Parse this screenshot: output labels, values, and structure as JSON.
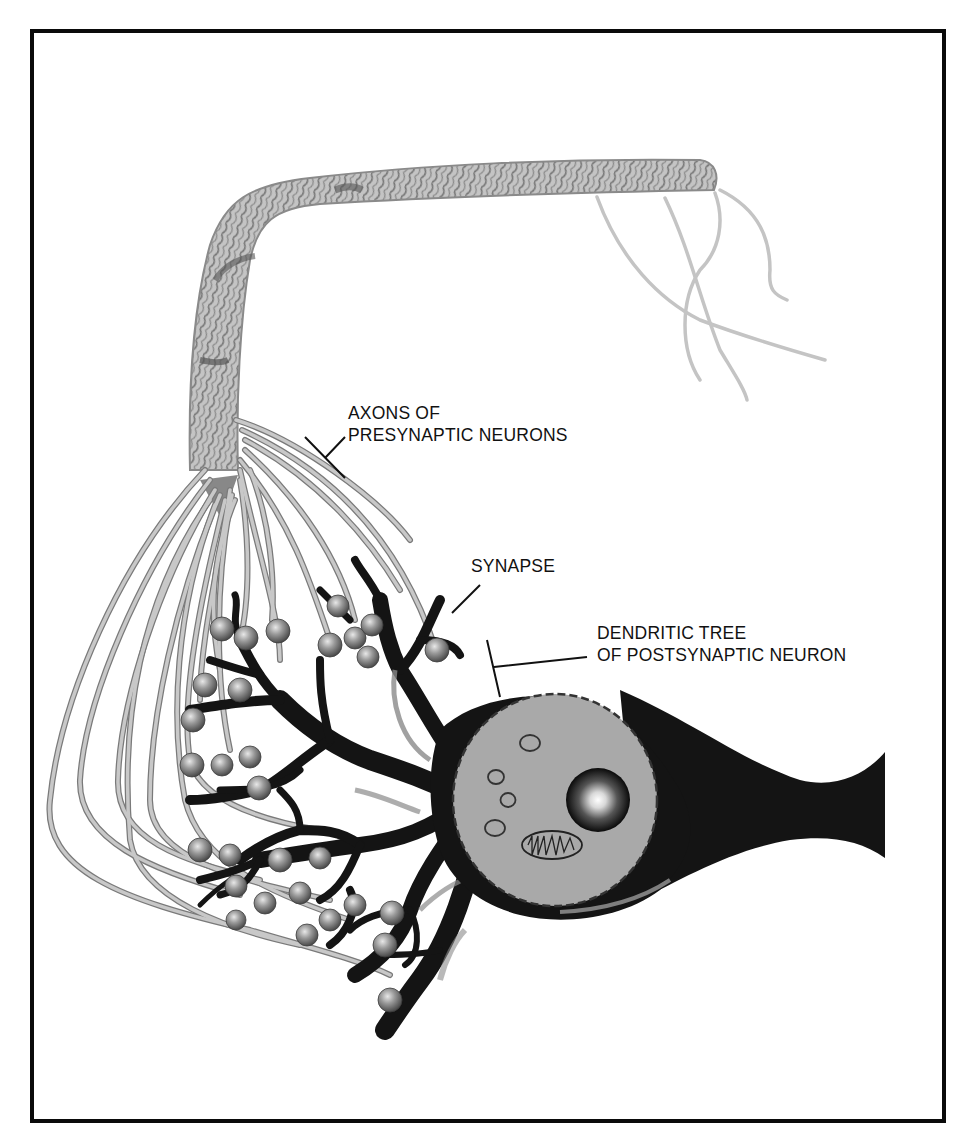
{
  "header": {
    "partial_text": "y, Inspire Biology"
  },
  "figure": {
    "colors": {
      "frame": "#0a0a0a",
      "axon_fill": "#bdbdbd",
      "axon_stroke": "#7a7a7a",
      "bundle_dark": "#6e6e6e",
      "neuron_body": "#141414",
      "nucleus_fill": "#a9a9a9",
      "terminal_bouton": "#8c8c8c",
      "background": "#ffffff"
    },
    "labels": {
      "axons": {
        "line1": "AXONS OF",
        "line2": "PRESYNAPTIC NEURONS"
      },
      "synapse": {
        "line1": "SYNAPSE"
      },
      "dendritic_tree": {
        "line1": "DENDRITIC TREE",
        "line2": "OF POSTSYNAPTIC NEURON"
      }
    }
  }
}
